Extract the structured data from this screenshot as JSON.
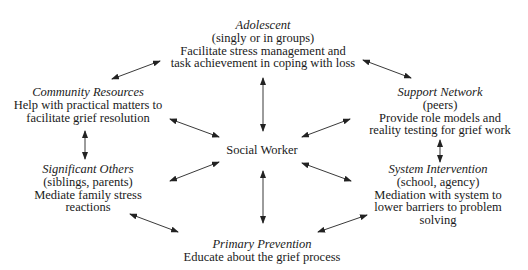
{
  "diagram": {
    "center": {
      "label": "Social Worker"
    },
    "nodes": {
      "adolescent": {
        "title": "Adolescent",
        "subtitle": "(singly or in groups)",
        "lines": [
          "Facilitate stress management and",
          "task achievement in coping with loss"
        ]
      },
      "community": {
        "title": "Community Resources",
        "lines": [
          "Help with practical matters to",
          "facilitate grief resolution"
        ]
      },
      "support": {
        "title": "Support Network",
        "subtitle": "(peers)",
        "lines": [
          "Provide role models and",
          "reality testing for grief work"
        ]
      },
      "significant": {
        "title": "Significant Others",
        "subtitle": "(siblings, parents)",
        "lines": [
          "Mediate family stress",
          "reactions"
        ]
      },
      "system": {
        "title": "System Intervention",
        "subtitle": "(school, agency)",
        "lines": [
          "Mediation with system to",
          "lower barriers to problem",
          "solving"
        ]
      },
      "primary": {
        "title": "Primary Prevention",
        "lines": [
          "Educate about the grief process"
        ]
      }
    },
    "edges": [
      {
        "from": "adolescent",
        "to": "community",
        "type": "bidirectional"
      },
      {
        "from": "adolescent",
        "to": "support",
        "type": "bidirectional"
      },
      {
        "from": "adolescent",
        "to": "social-worker",
        "type": "bidirectional"
      },
      {
        "from": "community",
        "to": "social-worker",
        "type": "bidirectional"
      },
      {
        "from": "support",
        "to": "social-worker",
        "type": "bidirectional"
      },
      {
        "from": "community",
        "to": "significant",
        "type": "bidirectional"
      },
      {
        "from": "support",
        "to": "system",
        "type": "bidirectional"
      },
      {
        "from": "significant",
        "to": "social-worker",
        "type": "bidirectional"
      },
      {
        "from": "system",
        "to": "social-worker",
        "type": "bidirectional"
      },
      {
        "from": "primary",
        "to": "social-worker",
        "type": "bidirectional"
      },
      {
        "from": "significant",
        "to": "primary",
        "type": "bidirectional"
      },
      {
        "from": "system",
        "to": "primary",
        "type": "bidirectional"
      }
    ],
    "colors": {
      "text": "#1a1a1a",
      "arrow": "#222222",
      "background": "#ffffff"
    }
  }
}
